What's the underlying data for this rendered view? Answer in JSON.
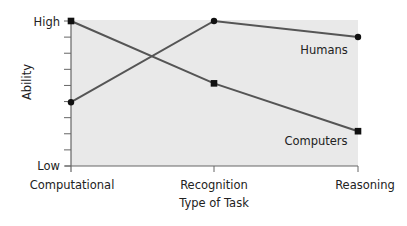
{
  "chart_data": {
    "type": "line",
    "title": "",
    "xlabel": "Type of Task",
    "ylabel": "Ability",
    "categories": [
      "Computational",
      "Recognition",
      "Reasoning"
    ],
    "y_tick_labels": {
      "top": "High",
      "bottom": "Low"
    },
    "ylim": [
      0,
      1
    ],
    "grid": false,
    "legend": "inline labels",
    "series": [
      {
        "name": "Humans",
        "marker": "circle",
        "values": [
          0.44,
          1.0,
          0.89
        ]
      },
      {
        "name": "Computers",
        "marker": "square",
        "values": [
          1.0,
          0.57,
          0.24
        ]
      }
    ],
    "colors": {
      "plot_bg": "#e9e9e9",
      "line": "#555555",
      "marker": "#111111",
      "axis": "#666666"
    }
  }
}
